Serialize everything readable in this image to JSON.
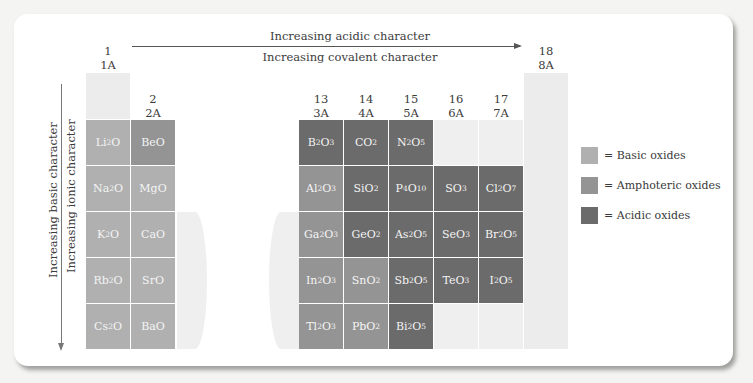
{
  "header": {
    "top_arrow_label": "Increasing acidic character",
    "bottom_arrow_label": "Increasing covalent character"
  },
  "side": {
    "outer_label": "Increasing basic character",
    "inner_label": "Increasing ionic character"
  },
  "groups": {
    "g1": {
      "num": "1",
      "old": "1A"
    },
    "g2": {
      "num": "2",
      "old": "2A"
    },
    "g13": {
      "num": "13",
      "old": "3A"
    },
    "g14": {
      "num": "14",
      "old": "4A"
    },
    "g15": {
      "num": "15",
      "old": "5A"
    },
    "g16": {
      "num": "16",
      "old": "6A"
    },
    "g17": {
      "num": "17",
      "old": "7A"
    },
    "g18": {
      "num": "18",
      "old": "8A"
    }
  },
  "colors": {
    "basic": "#b0b0b0",
    "amphoteric": "#949494",
    "acidic": "#6b6b6b"
  },
  "legend": [
    {
      "type": "basic",
      "label": "= Basic oxides"
    },
    {
      "type": "amphoteric",
      "label": "= Amphoteric oxides"
    },
    {
      "type": "acidic",
      "label": "= Acidic oxides"
    }
  ],
  "cells": [
    {
      "group": 1,
      "row": 1,
      "formula": "Li<sub>2</sub>O",
      "text": "Li2O",
      "type": "basic"
    },
    {
      "group": 1,
      "row": 2,
      "formula": "Na<sub>2</sub>O",
      "text": "Na2O",
      "type": "basic"
    },
    {
      "group": 1,
      "row": 3,
      "formula": "K<sub>2</sub>O",
      "text": "K2O",
      "type": "basic"
    },
    {
      "group": 1,
      "row": 4,
      "formula": "Rb<sub>2</sub>O",
      "text": "Rb2O",
      "type": "basic"
    },
    {
      "group": 1,
      "row": 5,
      "formula": "Cs<sub>2</sub>O",
      "text": "Cs2O",
      "type": "basic"
    },
    {
      "group": 2,
      "row": 1,
      "formula": "BeO",
      "text": "BeO",
      "type": "amphoteric"
    },
    {
      "group": 2,
      "row": 2,
      "formula": "MgO",
      "text": "MgO",
      "type": "basic"
    },
    {
      "group": 2,
      "row": 3,
      "formula": "CaO",
      "text": "CaO",
      "type": "basic"
    },
    {
      "group": 2,
      "row": 4,
      "formula": "SrO",
      "text": "SrO",
      "type": "basic"
    },
    {
      "group": 2,
      "row": 5,
      "formula": "BaO",
      "text": "BaO",
      "type": "basic"
    },
    {
      "group": 13,
      "row": 1,
      "formula": "B<sub>2</sub>O<sub>3</sub>",
      "text": "B2O3",
      "type": "acidic"
    },
    {
      "group": 13,
      "row": 2,
      "formula": "Al<sub>2</sub>O<sub>3</sub>",
      "text": "Al2O3",
      "type": "amphoteric"
    },
    {
      "group": 13,
      "row": 3,
      "formula": "Ga<sub>2</sub>O<sub>3</sub>",
      "text": "Ga2O3",
      "type": "amphoteric"
    },
    {
      "group": 13,
      "row": 4,
      "formula": "In<sub>2</sub>O<sub>3</sub>",
      "text": "In2O3",
      "type": "amphoteric"
    },
    {
      "group": 13,
      "row": 5,
      "formula": "Tl<sub>2</sub>O<sub>3</sub>",
      "text": "Tl2O3",
      "type": "amphoteric"
    },
    {
      "group": 14,
      "row": 1,
      "formula": "CO<sub>2</sub>",
      "text": "CO2",
      "type": "acidic"
    },
    {
      "group": 14,
      "row": 2,
      "formula": "SiO<sub>2</sub>",
      "text": "SiO2",
      "type": "acidic"
    },
    {
      "group": 14,
      "row": 3,
      "formula": "GeO<sub>2</sub>",
      "text": "GeO2",
      "type": "acidic"
    },
    {
      "group": 14,
      "row": 4,
      "formula": "SnO<sub>2</sub>",
      "text": "SnO2",
      "type": "amphoteric"
    },
    {
      "group": 14,
      "row": 5,
      "formula": "PbO<sub>2</sub>",
      "text": "PbO2",
      "type": "amphoteric"
    },
    {
      "group": 15,
      "row": 1,
      "formula": "N<sub>2</sub>O<sub>5</sub>",
      "text": "N2O5",
      "type": "acidic"
    },
    {
      "group": 15,
      "row": 2,
      "formula": "P<sub>4</sub>O<sub>10</sub>",
      "text": "P4O10",
      "type": "acidic"
    },
    {
      "group": 15,
      "row": 3,
      "formula": "As<sub>2</sub>O<sub>5</sub>",
      "text": "As2O5",
      "type": "acidic"
    },
    {
      "group": 15,
      "row": 4,
      "formula": "Sb<sub>2</sub>O<sub>5</sub>",
      "text": "Sb2O5",
      "type": "acidic"
    },
    {
      "group": 15,
      "row": 5,
      "formula": "Bi<sub>2</sub>O<sub>5</sub>",
      "text": "Bi2O5",
      "type": "acidic"
    },
    {
      "group": 16,
      "row": 2,
      "formula": "SO<sub>3</sub>",
      "text": "SO3",
      "type": "acidic"
    },
    {
      "group": 16,
      "row": 3,
      "formula": "SeO<sub>3</sub>",
      "text": "SeO3",
      "type": "acidic"
    },
    {
      "group": 16,
      "row": 4,
      "formula": "TeO<sub>3</sub>",
      "text": "TeO3",
      "type": "acidic"
    },
    {
      "group": 17,
      "row": 2,
      "formula": "Cl<sub>2</sub>O<sub>7</sub>",
      "text": "Cl2O7",
      "type": "acidic"
    },
    {
      "group": 17,
      "row": 3,
      "formula": "Br<sub>2</sub>O<sub>5</sub>",
      "text": "Br2O5",
      "type": "acidic"
    },
    {
      "group": 17,
      "row": 4,
      "formula": "I<sub>2</sub>O<sub>5</sub>",
      "text": "I2O5",
      "type": "acidic"
    }
  ]
}
